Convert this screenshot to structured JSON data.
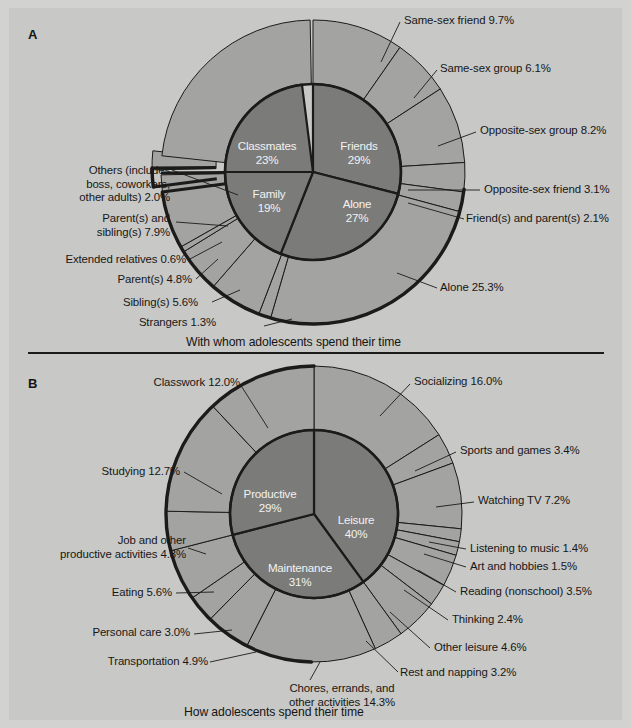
{
  "figure": {
    "panels": [
      {
        "letter": "A",
        "caption": "With whom adolescents spend their time",
        "inner": [
          {
            "label": "Friends",
            "pct": "29%",
            "value": 29
          },
          {
            "label": "Alone",
            "pct": "27%",
            "value": 27
          },
          {
            "label": "Family",
            "pct": "19%",
            "value": 19
          },
          {
            "label": "Classmates",
            "pct": "23%",
            "value": 23
          }
        ],
        "outer_labels": [
          {
            "text": "Same-sex friend 9.7%",
            "value": 9.7
          },
          {
            "text": "Same-sex group 6.1%",
            "value": 6.1
          },
          {
            "text": "Opposite-sex group 8.2%",
            "value": 8.2
          },
          {
            "text": "Opposite-sex friend 3.1%",
            "value": 3.1
          },
          {
            "text": "Friend(s) and parent(s) 2.1%",
            "value": 2.1
          },
          {
            "text": "Alone 25.3%",
            "value": 25.3
          },
          {
            "text": "Strangers 1.3%",
            "value": 1.3
          },
          {
            "text": "Sibling(s) 5.6%",
            "value": 5.6
          },
          {
            "text": "Parent(s) 4.8%",
            "value": 4.8
          },
          {
            "text": "Extended relatives 0.6%",
            "value": 0.6
          },
          {
            "text": "Parent(s) and\nsibling(s) 7.9%",
            "value": 7.9
          },
          {
            "text": "Others (includes\nboss, coworkers,\nother adults) 2.0%",
            "value": 2.0
          },
          {
            "text": "Classmates 23%",
            "value": 23.0
          }
        ]
      },
      {
        "letter": "B",
        "caption": "How adolescents spend their time",
        "inner": [
          {
            "label": "Leisure",
            "pct": "40%",
            "value": 40
          },
          {
            "label": "Maintenance",
            "pct": "31%",
            "value": 31
          },
          {
            "label": "Productive",
            "pct": "29%",
            "value": 29
          }
        ],
        "outer_labels": [
          {
            "text": "Socializing 16.0%",
            "value": 16.0
          },
          {
            "text": "Sports and games 3.4%",
            "value": 3.4
          },
          {
            "text": "Watching TV 7.2%",
            "value": 7.2
          },
          {
            "text": "Listening to music 1.4%",
            "value": 1.4
          },
          {
            "text": "Art and hobbies 1.5%",
            "value": 1.5
          },
          {
            "text": "Reading (nonschool) 3.5%",
            "value": 3.5
          },
          {
            "text": "Thinking 2.4%",
            "value": 2.4
          },
          {
            "text": "Other leisure 4.6%",
            "value": 4.6
          },
          {
            "text": "Rest and napping 3.2%",
            "value": 3.2
          },
          {
            "text": "Chores, errands, and\nother activities 14.3%",
            "value": 14.3
          },
          {
            "text": "Transportation 4.9%",
            "value": 4.9
          },
          {
            "text": "Personal care 3.0%",
            "value": 3.0
          },
          {
            "text": "Eating 5.6%",
            "value": 5.6
          },
          {
            "text": "Job and other\nproductive activities 4.3%",
            "value": 4.3
          },
          {
            "text": "Studying 12.7%",
            "value": 12.7
          },
          {
            "text": "Classwork 12.0%",
            "value": 12.0
          }
        ]
      }
    ]
  },
  "colors": {
    "background": "#c8c8c6",
    "outer_ring": "#a3a3a1",
    "inner_pie": "#7b7b79",
    "stroke": "#1b1b1b",
    "slice_text": "#f2f2f2"
  },
  "chart_data": [
    {
      "type": "pie",
      "title": "With whom adolescents spend their time",
      "panel": "A",
      "inner_ring": {
        "categories": [
          "Friends",
          "Alone",
          "Family",
          "Classmates"
        ],
        "values": [
          29,
          27,
          19,
          23
        ],
        "unit": "percent"
      },
      "outer_ring": {
        "categories": [
          "Same-sex friend",
          "Same-sex group",
          "Opposite-sex group",
          "Opposite-sex friend",
          "Friend(s) and parent(s)",
          "Alone",
          "Strangers",
          "Sibling(s)",
          "Parent(s)",
          "Extended relatives",
          "Parent(s) and sibling(s)",
          "Others (includes boss, coworkers, other adults)",
          "Classmates"
        ],
        "values": [
          9.7,
          6.1,
          8.2,
          3.1,
          2.1,
          25.3,
          1.3,
          5.6,
          4.8,
          0.6,
          7.9,
          2.0,
          23.0
        ],
        "unit": "percent"
      },
      "legend": "none",
      "grid": false
    },
    {
      "type": "pie",
      "title": "How adolescents spend their time",
      "panel": "B",
      "inner_ring": {
        "categories": [
          "Leisure",
          "Maintenance",
          "Productive"
        ],
        "values": [
          40,
          31,
          29
        ],
        "unit": "percent"
      },
      "outer_ring": {
        "categories": [
          "Socializing",
          "Sports and games",
          "Watching TV",
          "Listening to music",
          "Art and hobbies",
          "Reading (nonschool)",
          "Thinking",
          "Other leisure",
          "Rest and napping",
          "Chores, errands, and other activities",
          "Transportation",
          "Personal care",
          "Eating",
          "Job and other productive activities",
          "Studying",
          "Classwork"
        ],
        "values": [
          16.0,
          3.4,
          7.2,
          1.4,
          1.5,
          3.5,
          2.4,
          4.6,
          3.2,
          14.3,
          4.9,
          3.0,
          5.6,
          12.7,
          12.0
        ],
        "unit": "percent"
      },
      "legend": "none",
      "grid": false
    }
  ]
}
